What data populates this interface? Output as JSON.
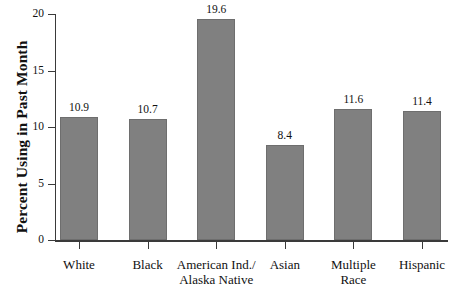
{
  "chart_data": {
    "type": "bar",
    "title": "",
    "xlabel": "",
    "ylabel": "Percent Using in Past Month",
    "ylim": [
      0,
      20
    ],
    "yticks": [
      0,
      5,
      10,
      15,
      20
    ],
    "ytick_labels": [
      "0",
      "5",
      "10",
      "15",
      "20"
    ],
    "grid": false,
    "legend": null,
    "bar_color": "#808080",
    "categories": [
      "White",
      "Black",
      "American Ind./ Alaska Native",
      "Asian",
      "Multiple Race",
      "Hispanic"
    ],
    "category_lines": [
      [
        "White"
      ],
      [
        "Black"
      ],
      [
        "American Ind./",
        "Alaska Native"
      ],
      [
        "Asian"
      ],
      [
        "Multiple",
        "Race"
      ],
      [
        "Hispanic"
      ]
    ],
    "values": [
      10.9,
      10.7,
      19.6,
      8.4,
      11.6,
      11.4
    ],
    "value_labels": [
      "10.9",
      "10.7",
      "19.6",
      "8.4",
      "11.6",
      "11.4"
    ]
  }
}
